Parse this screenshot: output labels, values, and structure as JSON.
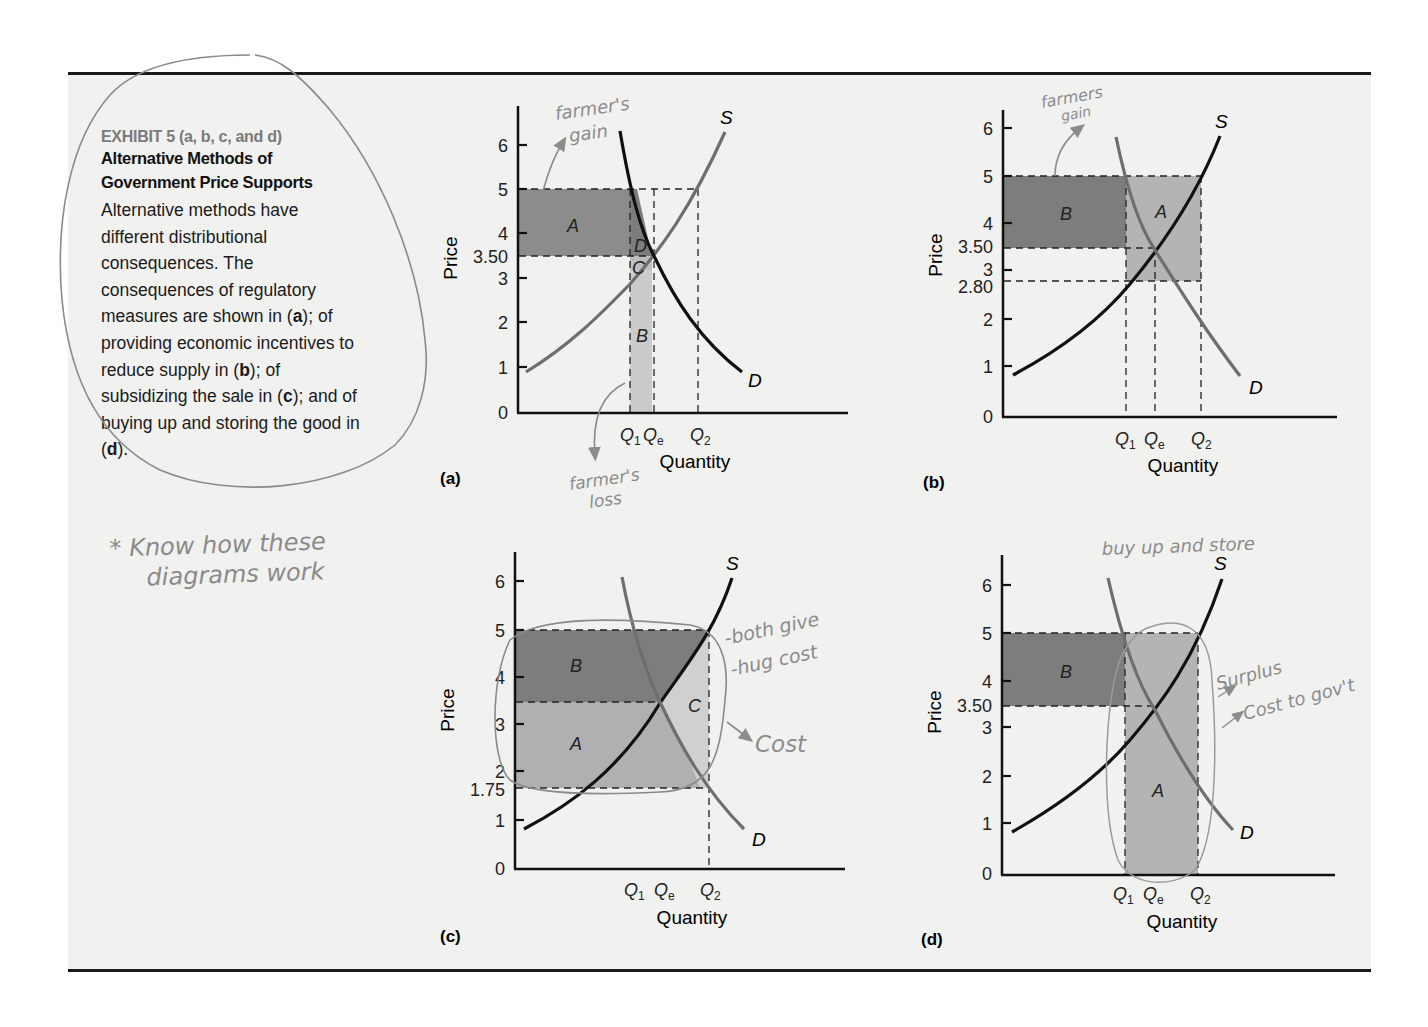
{
  "caption": {
    "exhibit": "EXHIBIT 5 (a, b, c, and d)",
    "title_line1": "Alternative Methods of",
    "title_line2": "Government Price Supports",
    "body_lines": [
      "Alternative methods have",
      "different distributional",
      "consequences. The",
      "consequences of regulatory",
      "measures are shown in (a); of",
      "providing economic incentives to",
      "reduce supply in (b); of",
      "subsidizing the sale in (c); and of",
      "buying up and storing the good in",
      "(d)."
    ]
  },
  "handwritten": {
    "note_line1": "* Know how these",
    "note_line2": "diagrams work",
    "a_gain": [
      "farmer's",
      "gain"
    ],
    "a_loss": [
      "farmer's",
      "loss"
    ],
    "b_gain": [
      "farmers",
      "gain"
    ],
    "c_note1": "-both give",
    "c_note2": "-hug cost",
    "c_cost": "Cost",
    "d_title": "buy up and store",
    "d_note1": "Surplus",
    "d_note2": "Cost to gov't"
  },
  "colors": {
    "dark_fill": "#7d7d7d",
    "light_fill": "#b4b4b4",
    "lighter_fill": "#cdcdcd",
    "black_curve": "#111111",
    "gray_curve": "#6e6e6e",
    "annotation": "#8c8c8c",
    "background": "#f1f1f0"
  },
  "axes": {
    "ylabel": "Price",
    "xlabel": "Quantity",
    "q1": "Q1",
    "qe": "Qe",
    "q2": "Q2",
    "supply": "S",
    "demand": "D"
  },
  "chart_data": [
    {
      "panel": "(a)",
      "type": "line",
      "title": "Regulatory measures",
      "xlabel": "Quantity",
      "ylabel": "Price",
      "yticks": [
        "0",
        "1",
        "2",
        "3",
        "3.50",
        "4",
        "5",
        "6"
      ],
      "xticks": [
        "Q1",
        "Qe",
        "Q2"
      ],
      "ylim": [
        0,
        6.5
      ],
      "series": [
        {
          "name": "S",
          "color": "gray",
          "points": [
            [
              0.05,
              0.85
            ],
            [
              0.8,
              2.9
            ],
            [
              0.95,
              3.5
            ],
            [
              1.25,
              5.0
            ],
            [
              1.45,
              6.2
            ]
          ]
        },
        {
          "name": "D",
          "color": "black",
          "points": [
            [
              0.4,
              6.4
            ],
            [
              0.8,
              5.0
            ],
            [
              0.95,
              3.5
            ],
            [
              1.2,
              2.0
            ],
            [
              1.55,
              0.75
            ]
          ]
        }
      ],
      "price_support": 5.0,
      "equilibrium_price": 3.5,
      "regions": [
        {
          "label": "A",
          "shade": "dark",
          "desc": "from 3.50 to 5, 0 to Q1"
        },
        {
          "label": "D",
          "shade": "dark",
          "desc": "triangle between Q1 and Qe above 3.50"
        },
        {
          "label": "C",
          "shade": "light",
          "desc": "triangle between Q1 and Qe below 3.50"
        },
        {
          "label": "B",
          "shade": "light",
          "desc": "from 0 to supply curve, Q1 to Qe"
        }
      ]
    },
    {
      "panel": "(b)",
      "type": "line",
      "title": "Economic incentives to reduce supply",
      "xlabel": "Quantity",
      "ylabel": "Price",
      "yticks": [
        "0",
        "1",
        "2",
        "2.80",
        "3",
        "3.50",
        "4",
        "5",
        "6"
      ],
      "xticks": [
        "Q1",
        "Qe",
        "Q2"
      ],
      "ylim": [
        0,
        6.5
      ],
      "series": [
        {
          "name": "S",
          "color": "black"
        },
        {
          "name": "D",
          "color": "gray"
        }
      ],
      "price_support": 5.0,
      "equilibrium_price": 3.5,
      "supply_price_at_Q1": 2.8,
      "regions": [
        {
          "label": "B",
          "shade": "dark",
          "desc": "3.50 to 5, 0 to Q1"
        },
        {
          "label": "A",
          "shade": "light",
          "desc": "2.80 to 5, Q1 to Q2"
        }
      ]
    },
    {
      "panel": "(c)",
      "type": "line",
      "title": "Subsidizing the sale",
      "xlabel": "Quantity",
      "ylabel": "Price",
      "yticks": [
        "0",
        "1",
        "1.75",
        "2",
        "3",
        "4",
        "5",
        "6"
      ],
      "xticks": [
        "Q1",
        "Qe",
        "Q2"
      ],
      "ylim": [
        0,
        6.5
      ],
      "series": [
        {
          "name": "S",
          "color": "black"
        },
        {
          "name": "D",
          "color": "gray"
        }
      ],
      "price_support": 5.0,
      "equilibrium_price": 3.5,
      "demand_price_at_Q2": 1.75,
      "regions": [
        {
          "label": "B",
          "shade": "dark",
          "desc": "3.50 to 5, 0 to Q2"
        },
        {
          "label": "A",
          "shade": "medium",
          "desc": "1.75 to 3.50, 0 to Q2"
        },
        {
          "label": "C",
          "shade": "light",
          "desc": "triangle right of curves, Qe to Q2"
        }
      ]
    },
    {
      "panel": "(d)",
      "type": "line",
      "title": "Buying up and storing the good",
      "xlabel": "Quantity",
      "ylabel": "Price",
      "yticks": [
        "0",
        "1",
        "2",
        "3",
        "3.50",
        "4",
        "5",
        "6"
      ],
      "xticks": [
        "Q1",
        "Qe",
        "Q2"
      ],
      "ylim": [
        0,
        6.5
      ],
      "series": [
        {
          "name": "S",
          "color": "black"
        },
        {
          "name": "D",
          "color": "gray"
        }
      ],
      "price_support": 5.0,
      "equilibrium_price": 3.5,
      "regions": [
        {
          "label": "B",
          "shade": "dark",
          "desc": "3.50 to 5, 0 to Q1"
        },
        {
          "label": "A",
          "shade": "light",
          "desc": "0 to 5, Q1 to Q2"
        }
      ]
    }
  ],
  "panel_labels": {
    "a": "(a)",
    "b": "(b)",
    "c": "(c)",
    "d": "(d)"
  }
}
